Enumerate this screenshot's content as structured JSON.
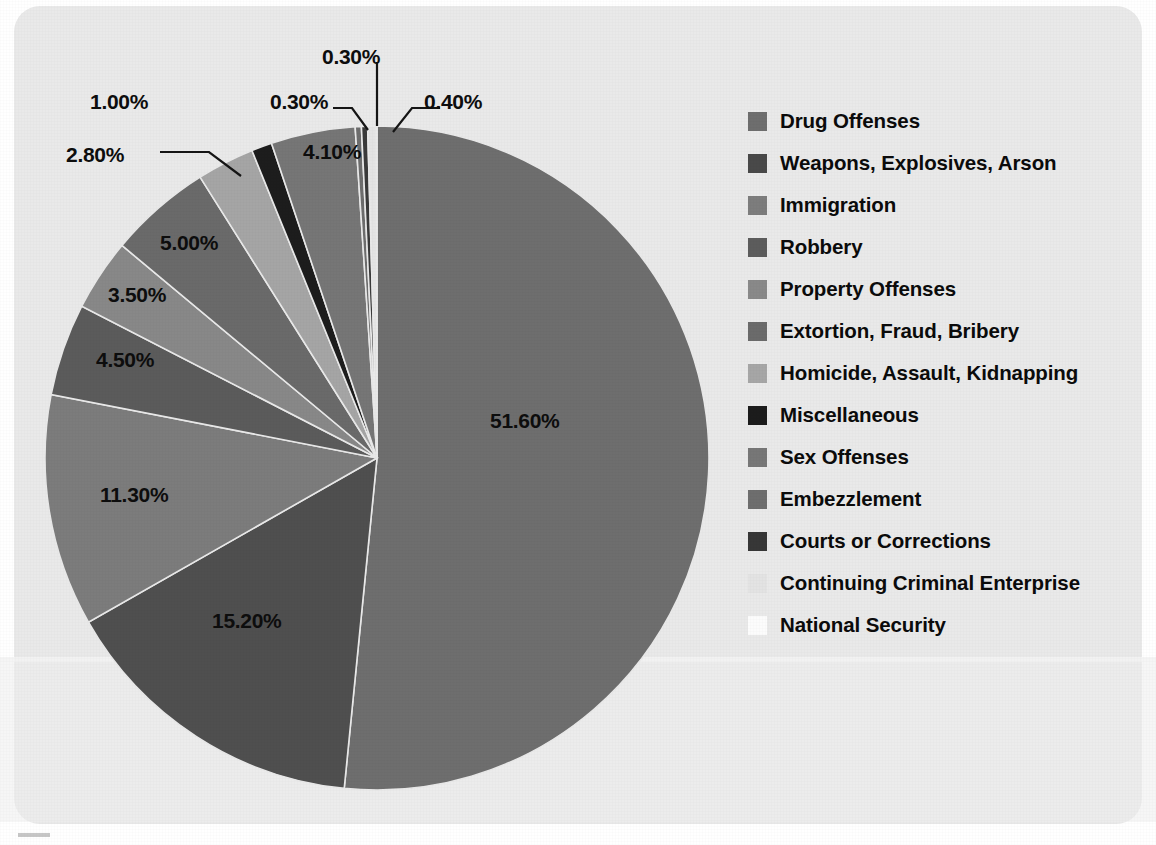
{
  "chart_data": {
    "type": "pie",
    "title": "",
    "subtitle": "",
    "xlabel": "",
    "ylabel": "",
    "grid": false,
    "legend_position": "right",
    "value_suffix": "%",
    "start_angle_deg": 0,
    "direction": "clockwise",
    "categories": [
      "Drug Offenses",
      "Weapons, Explosives, Arson",
      "Immigration",
      "Robbery",
      "Property Offenses",
      "Extortion, Fraud, Bribery",
      "Homicide, Assault, Kidnapping",
      "Miscellaneous",
      "Sex Offenses",
      "Embezzlement",
      "Courts or Corrections",
      "Continuing Criminal Enterprise",
      "National Security"
    ],
    "values": [
      51.6,
      15.2,
      11.3,
      4.5,
      3.5,
      5.0,
      2.8,
      1.0,
      4.1,
      0.3,
      0.3,
      0.4,
      0.05
    ],
    "labels": [
      "51.60%",
      "15.20%",
      "11.30%",
      "4.50%",
      "3.50%",
      "5.00%",
      "2.80%",
      "1.00%",
      "4.10%",
      "0.30%",
      "0.30%",
      "0.40%",
      ""
    ],
    "colors": [
      "#6e6e6e",
      "#4f4f4f",
      "#7c7c7c",
      "#5b5b5b",
      "#888888",
      "#6a6a6a",
      "#a5a5a5",
      "#1d1d1d",
      "#767676",
      "#6d6d6d",
      "#3a3a3a",
      "#e4e4e4",
      "#fbfbfb"
    ]
  },
  "legend": {
    "items": [
      {
        "label": "Drug Offenses",
        "color": "#6e6e6e"
      },
      {
        "label": "Weapons, Explosives, Arson",
        "color": "#494949"
      },
      {
        "label": "Immigration",
        "color": "#7d7d7d"
      },
      {
        "label": "Robbery",
        "color": "#5c5c5c"
      },
      {
        "label": "Property Offenses",
        "color": "#898989"
      },
      {
        "label": "Extortion, Fraud, Bribery",
        "color": "#6b6b6b"
      },
      {
        "label": "Homicide, Assault, Kidnapping",
        "color": "#a6a6a6"
      },
      {
        "label": "Miscellaneous",
        "color": "#1c1c1c"
      },
      {
        "label": "Sex Offenses",
        "color": "#777777"
      },
      {
        "label": "Embezzlement",
        "color": "#6e6e6e"
      },
      {
        "label": "Courts or Corrections",
        "color": "#373737"
      },
      {
        "label": "Continuing Criminal Enterprise",
        "color": "#e3e3e3"
      },
      {
        "label": "National Security",
        "color": "#fcfcfc"
      }
    ]
  },
  "callouts": [
    {
      "id": "c-030-top",
      "text": "0.30%",
      "x": 322,
      "y": 45,
      "size": 21
    },
    {
      "id": "c-100",
      "text": "1.00%",
      "x": 90,
      "y": 90,
      "size": 21
    },
    {
      "id": "c-030-mid",
      "text": "0.30%",
      "x": 270,
      "y": 90,
      "size": 21
    },
    {
      "id": "c-040",
      "text": "0.40%",
      "x": 424,
      "y": 90,
      "size": 21
    },
    {
      "id": "c-280",
      "text": "2.80%",
      "x": 66,
      "y": 143,
      "size": 21
    },
    {
      "id": "c-410",
      "text": "4.10%",
      "x": 303,
      "y": 140,
      "size": 21
    },
    {
      "id": "c-500",
      "text": "5.00%",
      "x": 160,
      "y": 231,
      "size": 21
    },
    {
      "id": "c-350",
      "text": "3.50%",
      "x": 108,
      "y": 283,
      "size": 21
    },
    {
      "id": "c-450",
      "text": "4.50%",
      "x": 96,
      "y": 348,
      "size": 21
    },
    {
      "id": "c-1130",
      "text": "11.30%",
      "x": 100,
      "y": 483,
      "size": 21
    },
    {
      "id": "c-1520",
      "text": "15.20%",
      "x": 212,
      "y": 609,
      "size": 21
    },
    {
      "id": "c-5160",
      "text": "51.60%",
      "x": 490,
      "y": 409,
      "size": 21
    }
  ],
  "geometry": {
    "center_x": 377,
    "center_y": 458,
    "radius": 332
  }
}
